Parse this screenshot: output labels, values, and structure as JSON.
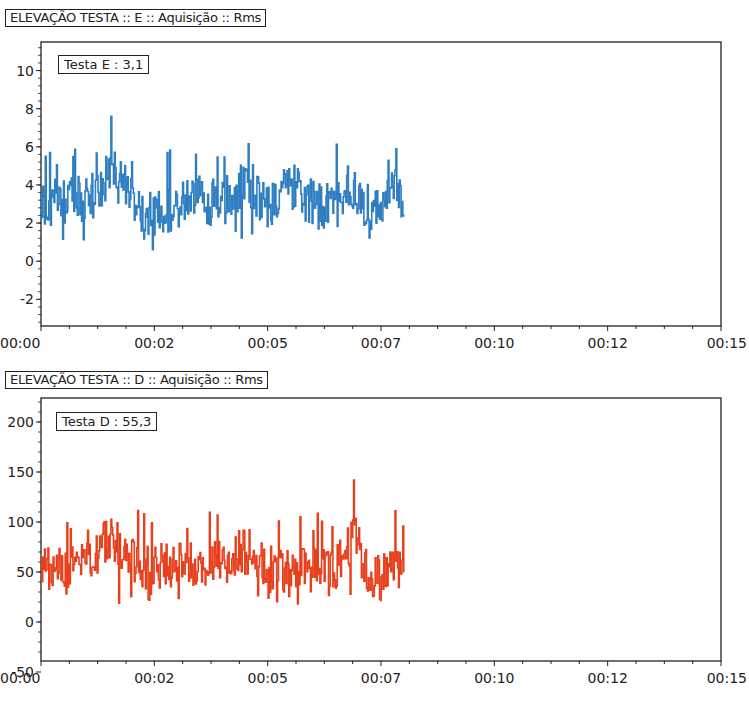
{
  "charts": [
    {
      "title": "ELEVAÇÃO TESTA :: E :: Aquisição :: Rms",
      "legend": "Testa E : 3,1",
      "color": "#2f7ec2"
    },
    {
      "title": "ELEVAÇÃO TESTA :: D :: Aquisição :: Rms",
      "legend": "Testa D : 55,3",
      "color": "#e8401c"
    }
  ],
  "chart_data": [
    {
      "type": "line",
      "title": "ELEVAÇÃO TESTA :: E :: Aquisição :: Rms",
      "legend": [
        "Testa E : 3,1"
      ],
      "xlabel": "",
      "ylabel": "",
      "x_tick_labels": [
        "00:00",
        "00:02",
        "00:05",
        "00:07",
        "00:10",
        "00:12",
        "00:15"
      ],
      "y_tick_labels": [
        "-2",
        "0",
        "2",
        "4",
        "6",
        "8",
        "10"
      ],
      "xlim_seconds": [
        0,
        15
      ],
      "ylim": [
        -3.4,
        11.5
      ],
      "grid": false,
      "series": [
        {
          "name": "Testa E",
          "color": "#2f7ec2",
          "x_range_seconds": [
            0,
            8.0
          ],
          "summary": {
            "mean": 3.1,
            "min": 0.6,
            "max": 7.6,
            "typical_range": [
              1.5,
              5.0
            ]
          },
          "envelope_points": [
            {
              "t": 0.0,
              "v": 2.8
            },
            {
              "t": 0.4,
              "v": 3.0
            },
            {
              "t": 0.8,
              "v": 3.3
            },
            {
              "t": 1.2,
              "v": 4.2
            },
            {
              "t": 1.55,
              "v": 7.6
            },
            {
              "t": 2.0,
              "v": 3.8
            },
            {
              "t": 2.45,
              "v": 0.6
            },
            {
              "t": 3.0,
              "v": 3.0
            },
            {
              "t": 3.5,
              "v": 3.4
            },
            {
              "t": 4.0,
              "v": 3.0
            },
            {
              "t": 4.45,
              "v": 5.7
            },
            {
              "t": 5.0,
              "v": 2.7
            },
            {
              "t": 5.55,
              "v": 5.6
            },
            {
              "t": 6.0,
              "v": 2.6
            },
            {
              "t": 6.5,
              "v": 2.4
            },
            {
              "t": 6.75,
              "v": 5.9
            },
            {
              "t": 7.1,
              "v": 2.8
            },
            {
              "t": 7.55,
              "v": 1.2
            },
            {
              "t": 7.65,
              "v": 6.1
            },
            {
              "t": 8.0,
              "v": 3.4
            }
          ]
        }
      ]
    },
    {
      "type": "line",
      "title": "ELEVAÇÃO TESTA :: D :: Aquisição :: Rms",
      "legend": [
        "Testa D : 55,3"
      ],
      "xlabel": "",
      "ylabel": "",
      "x_tick_labels": [
        "00:00",
        "00:02",
        "00:05",
        "00:07",
        "00:10",
        "00:12",
        "00:15"
      ],
      "y_tick_labels": [
        "-50",
        "0",
        "50",
        "100",
        "150",
        "200"
      ],
      "xlim_seconds": [
        0,
        15
      ],
      "ylim": [
        -39,
        224
      ],
      "grid": false,
      "series": [
        {
          "name": "Testa D",
          "color": "#e8401c",
          "x_range_seconds": [
            0,
            8.0
          ],
          "summary": {
            "mean": 55.3,
            "min": 18,
            "max": 142,
            "typical_range": [
              30,
              95
            ]
          },
          "envelope_points": [
            {
              "t": 0.0,
              "v": 60
            },
            {
              "t": 0.5,
              "v": 50
            },
            {
              "t": 1.0,
              "v": 58
            },
            {
              "t": 1.4,
              "v": 125
            },
            {
              "t": 1.65,
              "v": 127
            },
            {
              "t": 2.0,
              "v": 70
            },
            {
              "t": 2.5,
              "v": 50
            },
            {
              "t": 3.0,
              "v": 65
            },
            {
              "t": 3.5,
              "v": 58
            },
            {
              "t": 4.0,
              "v": 62
            },
            {
              "t": 4.35,
              "v": 105
            },
            {
              "t": 5.0,
              "v": 48
            },
            {
              "t": 5.5,
              "v": 50
            },
            {
              "t": 6.0,
              "v": 45
            },
            {
              "t": 6.5,
              "v": 52
            },
            {
              "t": 6.9,
              "v": 142
            },
            {
              "t": 7.2,
              "v": 30
            },
            {
              "t": 7.5,
              "v": 25
            },
            {
              "t": 7.7,
              "v": 55
            },
            {
              "t": 8.0,
              "v": 65
            }
          ]
        }
      ]
    }
  ]
}
